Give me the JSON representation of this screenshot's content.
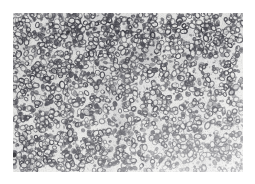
{
  "page": {
    "kind": "micrograph-plate",
    "canvas_width": 255,
    "canvas_height": 184,
    "page_background": "#ffffff",
    "caption": "",
    "title": "",
    "label": ""
  },
  "plate": {
    "name": "histological-micrograph",
    "subject": "dense field of small annular (ring-shaped) cells, blood-smear / tissue section appearance",
    "modality": "brightfield light microscopy, grayscale print reproduction",
    "x": 13,
    "y": 13,
    "width": 230,
    "height": 159,
    "background_color": "#e8e8e6",
    "cell_outline_color": "#4a4a50",
    "cell_fill_color": "#d9d9d7",
    "darkest_tone": "#2e2e33",
    "lightest_tone": "#f4f4f2",
    "border": "none",
    "has_scale_bar": false,
    "has_axes": false,
    "has_text": false
  },
  "texture": {
    "cell_count": 2600,
    "cell_min_diameter_px": 2.2,
    "cell_max_diameter_px": 5.2,
    "ring_stroke_px": 0.9,
    "ring_fraction": 0.62,
    "solid_fraction": 0.38,
    "random_seed": 20240417,
    "density_note": "denser and darker toward upper-left and mid-left; sparser and lighter toward lower-right corner",
    "grain_opacity": 0.5
  },
  "artifacts": [
    {
      "name": "dark-speck-left-edge",
      "x": 1,
      "y": 142,
      "radius": 2.4,
      "color": "#26262b"
    },
    {
      "name": "dark-speck-upper-left",
      "x": 55,
      "y": 19,
      "radius": 1.8,
      "color": "#343439"
    }
  ]
}
